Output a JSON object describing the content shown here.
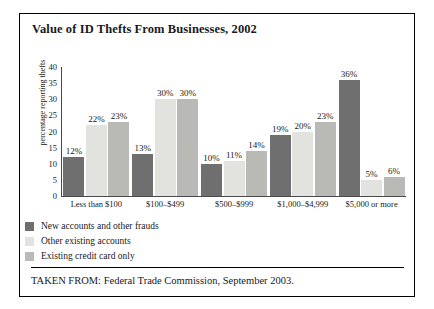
{
  "figure": {
    "title": "Value of ID Thefts From Businesses, 2002",
    "source": "TAKEN FROM: Federal Trade Commission, September 2003.",
    "border_color": "#000000"
  },
  "chart_data": {
    "type": "bar",
    "title": "Value of ID Thefts From Businesses, 2002",
    "xlabel": "",
    "ylabel": "percentage reporting thefts",
    "ylim": [
      0,
      40
    ],
    "yticks": [
      0,
      5,
      10,
      15,
      20,
      25,
      30,
      35,
      40
    ],
    "grid": false,
    "legend_position": "below-left",
    "categories": [
      "Less than $100",
      "$100–$499",
      "$500–$999",
      "$1,000–$4,999",
      "$5,000 or more"
    ],
    "series": [
      {
        "name": "New accounts and other frauds",
        "color": "#6f6f6f",
        "values": [
          12,
          13,
          10,
          19,
          36
        ],
        "labels": [
          "12%",
          "13%",
          "10%",
          "19%",
          "36%"
        ]
      },
      {
        "name": "Other existing accounts",
        "color": "#e2e2de",
        "values": [
          22,
          30,
          11,
          20,
          5
        ],
        "labels": [
          "22%",
          "30%",
          "11%",
          "20%",
          "5%"
        ]
      },
      {
        "name": "Existing credit card only",
        "color": "#b9b9b5",
        "values": [
          23,
          30,
          14,
          23,
          6
        ],
        "labels": [
          "23%",
          "30%",
          "14%",
          "23%",
          "6%"
        ]
      }
    ]
  }
}
